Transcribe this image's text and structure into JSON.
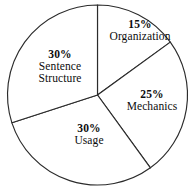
{
  "chart_data": {
    "type": "pie",
    "title": "",
    "subtitle": "",
    "xlabel": "",
    "ylabel": "",
    "legend_position": "none",
    "grid": false,
    "labels_on_slices": true,
    "start_angle_deg": 0,
    "direction": "clockwise",
    "categories": [
      "Organization",
      "Mechanics",
      "Usage",
      "Sentence Structure"
    ],
    "values": [
      15,
      25,
      30,
      30
    ],
    "value_suffix": "%",
    "slices": [
      {
        "name": "Organization",
        "percent": 15,
        "percent_label": "15%",
        "label": "Organization",
        "label_lines": [
          "15%",
          "Organization"
        ],
        "start_deg": 0,
        "end_deg": 54,
        "fill": "#ffffff"
      },
      {
        "name": "Mechanics",
        "percent": 25,
        "percent_label": "25%",
        "label": "Mechanics",
        "label_lines": [
          "25%",
          "Mechanics"
        ],
        "start_deg": 54,
        "end_deg": 144,
        "fill": "#ffffff"
      },
      {
        "name": "Usage",
        "percent": 30,
        "percent_label": "30%",
        "label": "Usage",
        "label_lines": [
          "30%",
          "Usage"
        ],
        "start_deg": 144,
        "end_deg": 252,
        "fill": "#ffffff"
      },
      {
        "name": "Sentence Structure",
        "percent": 30,
        "percent_label": "30%",
        "label": "Sentence Structure",
        "label_lines": [
          "30%",
          "Sentence",
          "Structure"
        ],
        "start_deg": 252,
        "end_deg": 360,
        "fill": "#ffffff"
      }
    ],
    "colors": {
      "background": "#ffffff",
      "slice_fill": "#ffffff",
      "outline": "#2b2b2b",
      "text": "#0d0d0d"
    }
  },
  "labels": {
    "organization": {
      "pct": "15%",
      "cat": "Organization"
    },
    "mechanics": {
      "pct": "25%",
      "cat": "Mechanics"
    },
    "usage": {
      "pct": "30%",
      "cat": "Usage"
    },
    "sentence_structure": {
      "pct": "30%",
      "cat_line1": "Sentence",
      "cat_line2": "Structure"
    }
  }
}
